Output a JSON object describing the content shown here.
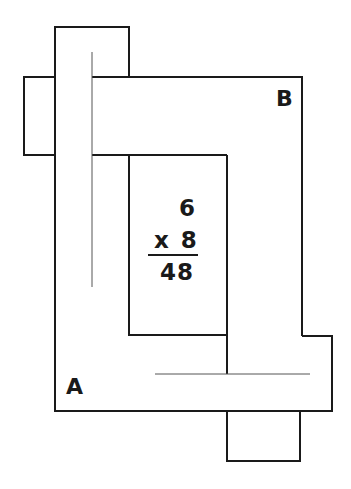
{
  "diagram": {
    "type": "interlocking-shapes-puzzle",
    "stroke_color": "#1a1a1a",
    "background": "#ffffff",
    "labels": {
      "a": "A",
      "b": "B"
    },
    "multiplication": {
      "top": "6",
      "operator_line": "x 8",
      "result": "48"
    }
  }
}
